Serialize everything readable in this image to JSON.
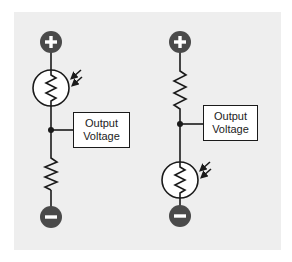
{
  "diagram": {
    "colors": {
      "background": "#ffffff",
      "panel": "#eeeeee",
      "wire": "#1a1a1a",
      "terminal": "#4a4a4a",
      "terminal_symbol": "#ffffff",
      "label_box_fill": "#ffffff"
    },
    "circuits": [
      {
        "id": "left",
        "top_terminal": {
          "symbol": "+",
          "icon": "plus-terminal-icon"
        },
        "upper_component": {
          "type": "photoresistor",
          "icon": "ldr-icon",
          "light_arrows": 2
        },
        "junction": {
          "label_line1": "Output",
          "label_line2": "Voltage"
        },
        "lower_component": {
          "type": "resistor",
          "icon": "resistor-icon"
        },
        "bottom_terminal": {
          "symbol": "−",
          "icon": "minus-terminal-icon"
        }
      },
      {
        "id": "right",
        "top_terminal": {
          "symbol": "+",
          "icon": "plus-terminal-icon"
        },
        "upper_component": {
          "type": "resistor",
          "icon": "resistor-icon"
        },
        "junction": {
          "label_line1": "Output",
          "label_line2": "Voltage"
        },
        "lower_component": {
          "type": "photoresistor",
          "icon": "ldr-icon",
          "light_arrows": 2
        },
        "bottom_terminal": {
          "symbol": "−",
          "icon": "minus-terminal-icon"
        }
      }
    ]
  }
}
